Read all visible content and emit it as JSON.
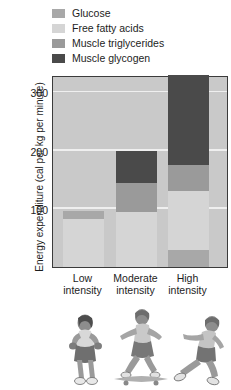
{
  "legend": {
    "items": [
      {
        "label": "Glucose",
        "color": "#a8a8a8"
      },
      {
        "label": "Free fatty acids",
        "color": "#d5d5d5"
      },
      {
        "label": "Muscle triglycerides",
        "color": "#9a9a9a"
      },
      {
        "label": "Muscle glycogen",
        "color": "#4a4a4a"
      }
    ]
  },
  "axes": {
    "ylabel": "Energy expenditure (cal per kg per minute)",
    "yticks": [
      "100",
      "200",
      "300"
    ],
    "xticks": [
      {
        "line1": "Low",
        "line2": "intensity"
      },
      {
        "line1": "Moderate",
        "line2": "intensity"
      },
      {
        "line1": "High",
        "line2": "intensity"
      }
    ]
  },
  "illustration": {
    "figures": [
      {
        "name": "walking-person-figure"
      },
      {
        "name": "skateboarding-person-figure"
      },
      {
        "name": "running-person-figure"
      }
    ]
  },
  "chart_data": {
    "type": "bar",
    "subtype": "stacked-bar",
    "title": "",
    "xlabel": "",
    "ylabel": "Energy expenditure (cal per kg per minute)",
    "ylim": [
      0,
      330
    ],
    "yticks": [
      100,
      200,
      300
    ],
    "grid": true,
    "legend_position": "top",
    "categories": [
      "Low intensity",
      "Moderate intensity",
      "High intensity"
    ],
    "series": [
      {
        "name": "Free fatty acids",
        "color": "#d5d5d5",
        "values": [
          82,
          95,
          100
        ]
      },
      {
        "name": "Glucose",
        "color": "#a8a8a8",
        "values": [
          15,
          0,
          30
        ]
      },
      {
        "name": "Muscle triglycerides",
        "color": "#9a9a9a",
        "values": [
          0,
          50,
          45
        ]
      },
      {
        "name": "Muscle glycogen",
        "color": "#4a4a4a",
        "values": [
          0,
          55,
          155
        ]
      }
    ],
    "totals": [
      97,
      200,
      300
    ],
    "stack_order_bottom_to_top": {
      "Low intensity": [
        "Free fatty acids",
        "Glucose"
      ],
      "Moderate intensity": [
        "Free fatty acids",
        "Muscle triglycerides",
        "Muscle glycogen"
      ],
      "High intensity": [
        "Glucose",
        "Free fatty acids",
        "Muscle triglycerides",
        "Muscle glycogen"
      ]
    }
  }
}
